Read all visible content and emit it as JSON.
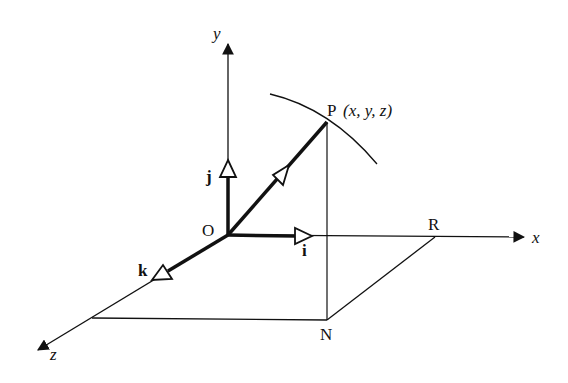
{
  "diagram": {
    "type": "3d-coordinate-vector-diagram",
    "labels": {
      "origin": "O",
      "axis_x": "x",
      "axis_y": "y",
      "axis_z": "z",
      "unit_i": "i",
      "unit_j": "j",
      "unit_k": "k",
      "point_p": "P",
      "point_p_coords": "(x, y, z)",
      "point_r": "R",
      "point_n": "N"
    },
    "colors": {
      "ink": "#111111",
      "background": "#ffffff"
    }
  }
}
